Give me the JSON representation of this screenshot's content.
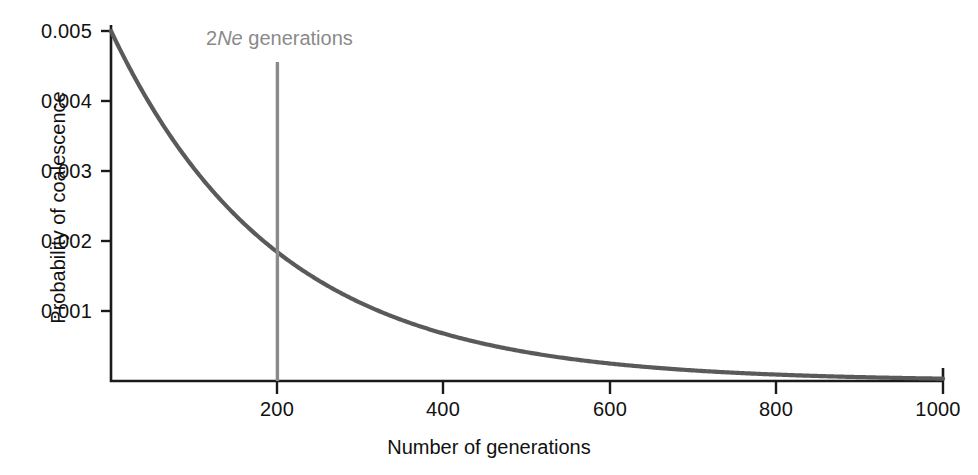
{
  "chart_data": {
    "type": "line",
    "title": "",
    "subtitle": "",
    "xlabel": "Number of generations",
    "ylabel": "Probability of coalescence",
    "xlim": [
      0,
      1000
    ],
    "ylim": [
      0,
      0.005
    ],
    "grid": false,
    "legend": "none",
    "x_ticks": [
      "200",
      "400",
      "600",
      "800",
      "1000"
    ],
    "x_tick_values": [
      200,
      400,
      600,
      800,
      1000
    ],
    "y_ticks": [
      "0.001",
      "0.002",
      "0.003",
      "0.004",
      "0.005"
    ],
    "y_tick_values": [
      0.001,
      0.002,
      0.003,
      0.004,
      0.005
    ],
    "series": [
      {
        "name": "Probability of coalescence",
        "color": "#5a5a5a",
        "description": "Exponential decay, P(t) = 0.005 * exp(-t/200)",
        "x": [
          0,
          25,
          50,
          75,
          100,
          125,
          150,
          175,
          200,
          250,
          300,
          350,
          400,
          450,
          500,
          550,
          600,
          650,
          700,
          750,
          800,
          850,
          900,
          950,
          1000
        ],
        "values": [
          0.005,
          0.004412,
          0.003894,
          0.003436,
          0.003033,
          0.002676,
          0.002362,
          0.002084,
          0.00184,
          0.001432,
          0.001116,
          0.000869,
          0.000677,
          0.000527,
          0.000411,
          0.00032,
          0.000249,
          0.000194,
          0.000151,
          0.000118,
          9.16e-05,
          7.13e-05,
          5.56e-05,
          4.33e-05,
          3.37e-05
        ]
      }
    ],
    "annotations": [
      {
        "name": "2Ne-generations-marker",
        "text_prefix": "2",
        "text_italic": "Ne",
        "text_suffix": " generations",
        "full_text": "2Ne generations",
        "x_value": 200,
        "color": "#8a8a8a",
        "line_from_y": 0.005,
        "line_to_y": 0
      }
    ]
  },
  "axes": {
    "x_title": "Number of generations",
    "y_title": "Probability of coalescence",
    "x_tick_labels": [
      "200",
      "400",
      "600",
      "800",
      "1000"
    ],
    "y_tick_labels": [
      "0.005",
      "0.004",
      "0.003",
      "0.002",
      "0.001"
    ]
  },
  "colors": {
    "curve": "#5a5a5a",
    "marker": "#8a8a8a",
    "axis": "#1a1a1a",
    "text": "#111111",
    "background": "#ffffff"
  }
}
